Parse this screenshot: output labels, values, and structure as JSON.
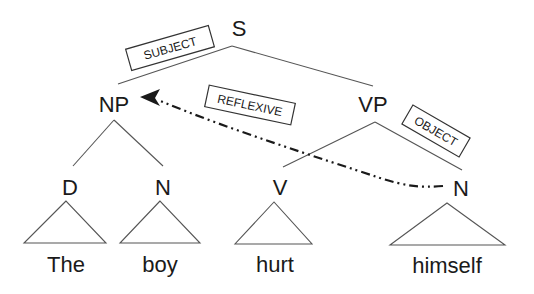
{
  "diagram": {
    "type": "syntax-tree",
    "nodes": {
      "s": "S",
      "np": "NP",
      "vp": "VP",
      "d": "D",
      "n1": "N",
      "v": "V",
      "n2": "N"
    },
    "words": {
      "the": "The",
      "boy": "boy",
      "hurt": "hurt",
      "himself": "himself"
    },
    "relations": {
      "subject": "SUBJECT",
      "object": "OBJECT",
      "reflexive": "REFLEXIVE"
    },
    "colors": {
      "edge": "#555555",
      "text": "#1a1a1a",
      "dependency_arrow": "#1a1a1a"
    }
  }
}
